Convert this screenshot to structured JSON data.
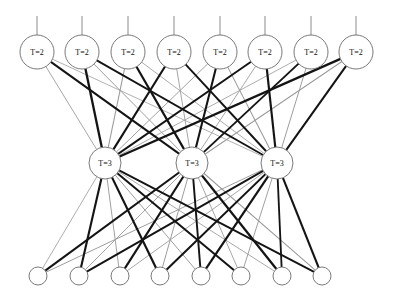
{
  "diagram": {
    "canvas": {
      "width": 393,
      "height": 302,
      "background": "#ffffff"
    },
    "layers": [
      {
        "id": "layer-top",
        "name": "top-layer",
        "label_text": "T=2",
        "radius": 17,
        "y": 52,
        "node_count": 8,
        "x_positions": [
          37,
          82,
          128,
          174,
          220,
          265,
          311,
          356
        ],
        "labels": [
          "T=2",
          "T=2",
          "T=2",
          "T=2",
          "T=2",
          "T=2",
          "T=2",
          "T=2"
        ],
        "has_stems": true,
        "stem_top_y": 16
      },
      {
        "id": "layer-middle",
        "name": "middle-layer",
        "label_text": "T=3",
        "radius": 16,
        "y": 163,
        "node_count": 3,
        "x_positions": [
          105,
          192,
          277
        ],
        "labels": [
          "T=3",
          "T=3",
          "T=3"
        ],
        "has_stems": false
      },
      {
        "id": "layer-bottom",
        "name": "bottom-layer",
        "label_text": "",
        "radius": 9,
        "y": 276,
        "node_count": 8,
        "x_positions": [
          38,
          79,
          120,
          160,
          201,
          241,
          282,
          322
        ],
        "labels": [
          "",
          "",
          "",
          "",
          "",
          "",
          "",
          ""
        ],
        "has_stems": false
      }
    ],
    "edge_groups": [
      {
        "id": "edges-top-middle",
        "name": "top-to-middle-edges",
        "from_layer": "layer-top",
        "to_layer": "layer-middle",
        "count": 24,
        "weights": [
          [
            0.25,
            0.85,
            0.2
          ],
          [
            1.0,
            0.3,
            0.75
          ],
          [
            0.35,
            0.95,
            0.22
          ],
          [
            0.9,
            0.25,
            0.8
          ],
          [
            0.28,
            0.88,
            0.35
          ],
          [
            0.8,
            0.24,
            0.92
          ],
          [
            0.22,
            0.78,
            0.3
          ],
          [
            0.95,
            0.32,
            0.85
          ]
        ]
      },
      {
        "id": "edges-middle-bottom",
        "name": "middle-to-bottom-edges",
        "from_layer": "layer-middle",
        "to_layer": "layer-bottom",
        "count": 24,
        "weights": [
          [
            0.22,
            0.9,
            0.28,
            0.95,
            0.3,
            0.85,
            0.24,
            0.78
          ],
          [
            0.88,
            0.26,
            0.92,
            0.3,
            0.8,
            0.25,
            0.95,
            0.32
          ],
          [
            0.3,
            0.82,
            0.25,
            0.88,
            0.95,
            0.28,
            0.75,
            0.9
          ]
        ]
      }
    ],
    "edge_style": {
      "min_width": 0.4,
      "max_width": 2.3,
      "light_color": "#9a9a9a",
      "dark_color": "#141414",
      "thin_threshold": 0.5
    }
  }
}
